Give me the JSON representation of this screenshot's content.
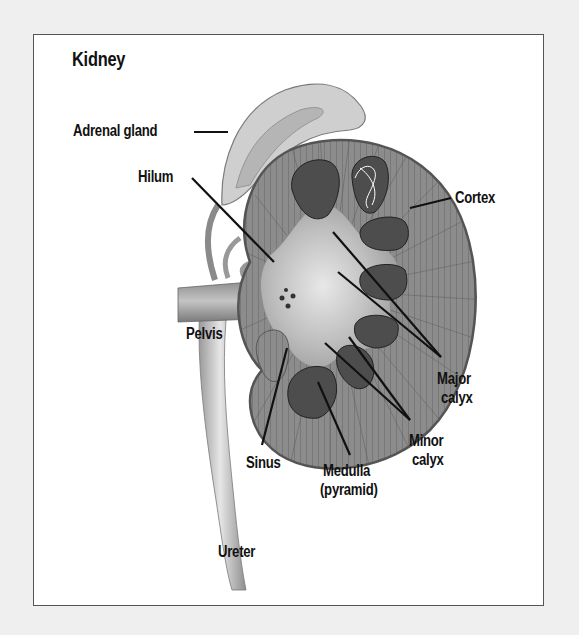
{
  "title": "Kidney",
  "labels": {
    "adrenal_gland": "Adrenal gland",
    "hilum": "Hilum",
    "cortex": "Cortex",
    "pelvis": "Pelvis",
    "major_calyx_1": "Major",
    "major_calyx_2": "calyx",
    "minor_calyx_1": "Minor",
    "minor_calyx_2": "calyx",
    "sinus": "Sinus",
    "medulla_1": "Medulla",
    "medulla_2": "(pyramid)",
    "ureter": "Ureter"
  },
  "colors": {
    "page_background": "#efefef",
    "frame_background": "#ffffff",
    "frame_border": "#555555",
    "cortex": "#8a8a8a",
    "medulla": "#4a4a4a",
    "sinus": "#c8c8c8",
    "adrenal": "#cfcfcf",
    "leader_line": "#111111"
  }
}
